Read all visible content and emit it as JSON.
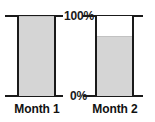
{
  "chart_data": {
    "type": "bar",
    "title": "",
    "subtitle": "",
    "xlabel": "",
    "ylabel": "",
    "categories": [
      "Month 1",
      "Month 2"
    ],
    "values": [
      100,
      75
    ],
    "value_unit": "%",
    "ylim": [
      0,
      100
    ],
    "grid": false,
    "legend": null,
    "legend_position": "none",
    "tick_labels": [
      "100%",
      "0%"
    ],
    "tick_values": [
      100,
      0
    ],
    "annotations": [],
    "series": [
      {
        "name": "Percent full",
        "values": [
          100,
          75
        ]
      }
    ],
    "colors": {
      "fill": "#d5d5d5",
      "outline": "#1a1a1a",
      "axis": "#1a1a1a",
      "text": "#111111",
      "background": "#ffffff"
    }
  },
  "axis": {
    "top_tick_label": "100%",
    "bottom_tick_label": "0%"
  },
  "bars": [
    {
      "id": "month-1",
      "label": "Month 1",
      "percent": 100,
      "fill_height_css": "100%"
    },
    {
      "id": "month-2",
      "label": "Month 2",
      "percent": 75,
      "fill_height_css": "75%"
    }
  ]
}
